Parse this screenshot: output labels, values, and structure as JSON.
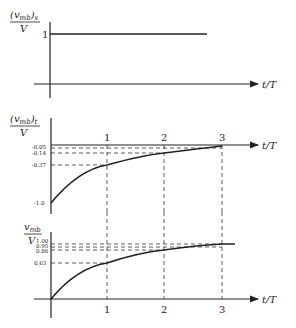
{
  "panels": [
    {
      "id": "steady",
      "ylabel_main": "(v",
      "ylabel_sub": "mb",
      "ylabel_close": ")",
      "ylabel_sub2": "s",
      "ylabel_den": "V",
      "yticks": [
        "1"
      ],
      "xlabel": "t/T"
    },
    {
      "id": "transient",
      "ylabel_main": "(v",
      "ylabel_sub": "mb",
      "ylabel_close": ")",
      "ylabel_sub2": "t",
      "ylabel_den": "V",
      "yticks": [
        "-0.05",
        "-0.14",
        "-0.37",
        "-1.0"
      ],
      "xticks": [
        "1",
        "2",
        "3"
      ],
      "xlabel": "t/T"
    },
    {
      "id": "total",
      "ylabel_main": "v",
      "ylabel_sub": "mb",
      "ylabel_den": "V",
      "yticks": [
        "1.00",
        "0.95",
        "0.86",
        "0.63"
      ],
      "xticks": [
        "1",
        "2",
        "3"
      ],
      "xlabel": "t/T"
    }
  ]
}
